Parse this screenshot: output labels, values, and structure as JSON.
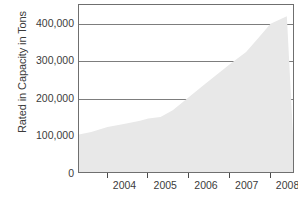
{
  "chart_data": {
    "type": "area",
    "title": "",
    "xlabel": "",
    "ylabel": "Rated in Capacity in Tons",
    "x": [
      2003.3,
      2003.6,
      2004,
      2004.4,
      2004.8,
      2005,
      2005.3,
      2005.6,
      2006,
      2006.4,
      2006.8,
      2007,
      2007.4,
      2007.7,
      2008,
      2008.4
    ],
    "values": [
      105000,
      112000,
      125000,
      133000,
      142000,
      148000,
      152000,
      170000,
      205000,
      240000,
      275000,
      292000,
      325000,
      362000,
      400000,
      420000
    ],
    "x_tick_labels": [
      "2004",
      "2005",
      "2006",
      "2007",
      "2008"
    ],
    "x_tick_values": [
      2004,
      2005,
      2006,
      2007,
      2008
    ],
    "y_tick_labels": [
      "0",
      "100,000",
      "200,000",
      "300,000",
      "400,000"
    ],
    "y_tick_values": [
      0,
      100000,
      200000,
      300000,
      400000
    ],
    "ylim": [
      0,
      450000
    ],
    "xlim": [
      2003.3,
      2008.6
    ],
    "grid": true,
    "legend": false,
    "series_name": "Rated Capacity",
    "colors": {
      "area_fill": "#e8e8e8",
      "gridline": "#7d7d7d",
      "frame": "#6f6f6f",
      "text": "#3b3b3b"
    }
  },
  "footnote": {
    "fragment": "____  __  __"
  }
}
